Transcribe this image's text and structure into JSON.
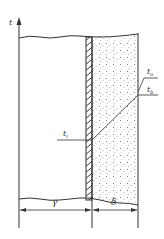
{
  "diagram": {
    "axis_label": "t",
    "labels": {
      "t_a": {
        "main": "t",
        "sub": "a"
      },
      "t_b": {
        "main": "t",
        "sub": "b"
      },
      "t_i": {
        "main": "t",
        "sub": "i"
      }
    },
    "dimensions": {
      "left": "γ",
      "right": "δ"
    },
    "colors": {
      "line": "#333333",
      "dots": "#555555",
      "background": "#ffffff"
    }
  }
}
